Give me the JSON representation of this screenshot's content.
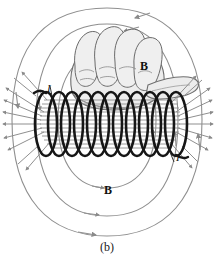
{
  "figure": {
    "caption": "(b)",
    "labels": {
      "field_upper": "B",
      "field_lower": "B",
      "current_left": "I",
      "current_right": "I"
    },
    "colors": {
      "coil_wire": "#1a1a1a",
      "field_line": "#8a8a8a",
      "hand_outline": "#6e6e6e",
      "hand_fill": "#ececec",
      "background": "#ffffff",
      "text": "#111111"
    },
    "elements": {
      "coil_turns": 11,
      "interior_field_lines": 13,
      "left_fringe_lines": 8,
      "right_fringe_lines": 8,
      "outer_loop_count": 3
    },
    "description_icons": {
      "solenoid": "solenoid-coil-icon",
      "hand": "right-hand-icon",
      "field": "magnetic-field-line-icon"
    }
  }
}
